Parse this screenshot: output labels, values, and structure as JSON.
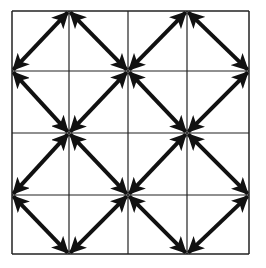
{
  "diagram": {
    "title": "",
    "grid": {
      "x_lines": [
        12,
        69,
        128,
        187,
        249
      ],
      "y_lines": [
        11,
        71,
        133,
        195,
        254
      ],
      "line_color": "#222222"
    },
    "arrow_color": "#111111",
    "diamonds": [
      {
        "id": "top-left",
        "top": [
          69,
          11
        ],
        "right": [
          128,
          71
        ],
        "bottom": [
          69,
          133
        ],
        "left": [
          12,
          71
        ]
      },
      {
        "id": "top-right",
        "top": [
          187,
          11
        ],
        "right": [
          249,
          71
        ],
        "bottom": [
          187,
          133
        ],
        "left": [
          128,
          71
        ]
      },
      {
        "id": "bottom-left",
        "top": [
          69,
          133
        ],
        "right": [
          128,
          195
        ],
        "bottom": [
          69,
          254
        ],
        "left": [
          12,
          195
        ]
      },
      {
        "id": "bottom-right",
        "top": [
          187,
          133
        ],
        "right": [
          249,
          195
        ],
        "bottom": [
          187,
          254
        ],
        "left": [
          128,
          195
        ]
      }
    ],
    "arrow_style": "double-headed"
  }
}
